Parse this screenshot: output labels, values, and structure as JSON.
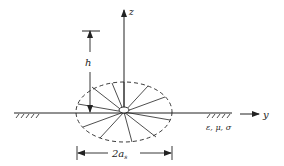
{
  "diagram": {
    "type": "radial-wire ground-screen antenna geometry",
    "axes": {
      "vertical_label": "z",
      "horizontal_label": "y"
    },
    "height_label": "h",
    "diameter_label": "2a",
    "diameter_subscript": "s",
    "ground_params_label": "ε, μ, σ",
    "radial_count": 12,
    "colors": {
      "line": "#222222",
      "background": "#ffffff"
    }
  }
}
